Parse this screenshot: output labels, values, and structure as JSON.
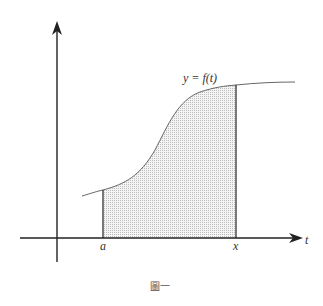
{
  "figure": {
    "curve_label": "y = f(t)",
    "x_axis_label": "t",
    "lower_bound_label": "a",
    "upper_bound_label": "x",
    "caption": "圖一"
  },
  "colors": {
    "ink": "#222222",
    "curve": "#666666",
    "shade": "#cfcfcf"
  }
}
